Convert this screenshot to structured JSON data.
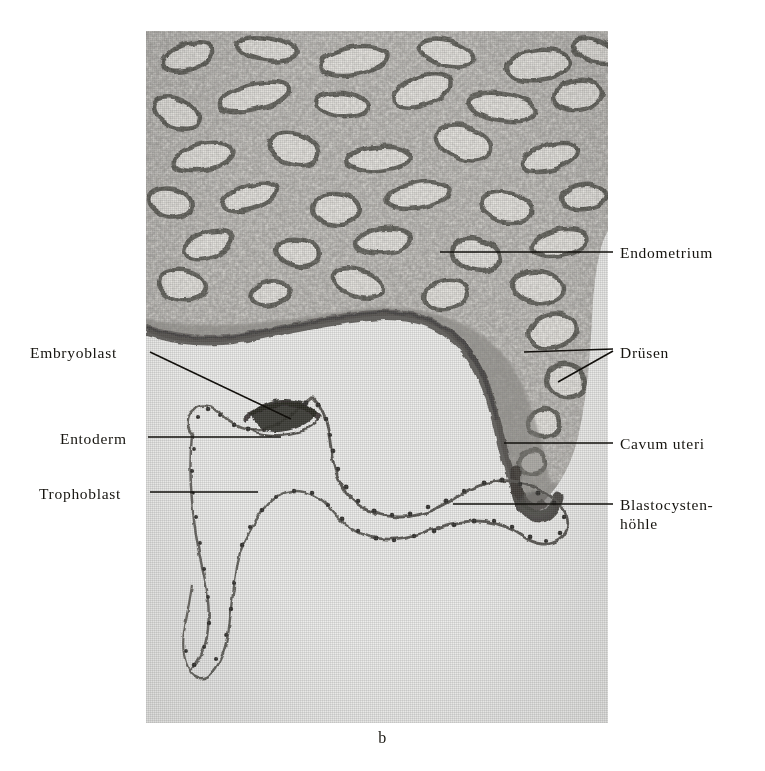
{
  "figure": {
    "caption": "b",
    "type": "histology-micrograph",
    "background_color": "#ededeb",
    "ink_color": "#16140f"
  },
  "labels": {
    "left": [
      {
        "id": "embryoblast",
        "text": "Embryoblast",
        "x": 30,
        "y": 343,
        "anchor_x": 143,
        "anchor_y": 351
      },
      {
        "id": "entoderm",
        "text": "Entoderm",
        "x": 60,
        "y": 429,
        "anchor_x": 143,
        "anchor_y": 437
      },
      {
        "id": "trophoblast",
        "text": "Trophoblast",
        "x": 39,
        "y": 484,
        "anchor_x": 143,
        "anchor_y": 492
      }
    ],
    "right": [
      {
        "id": "endometrium",
        "text": "Endometrium",
        "x": 620,
        "y": 243,
        "anchor_x": 613,
        "anchor_y": 252
      },
      {
        "id": "druesen",
        "text": "Drüsen",
        "x": 620,
        "y": 343,
        "anchor_x": 613,
        "anchor_y": 352
      },
      {
        "id": "cavum-uteri",
        "text": "Cavum uteri",
        "x": 620,
        "y": 434,
        "anchor_x": 613,
        "anchor_y": 443
      },
      {
        "id": "blastocystenhoehle-line1",
        "text": "Blastocysten-",
        "x": 620,
        "y": 495,
        "anchor_x": 613,
        "anchor_y": 504
      },
      {
        "id": "blastocystenhoehle-line2",
        "text": "höhle",
        "x": 620,
        "y": 514
      }
    ]
  },
  "leader_lines": [
    {
      "id": "leader-embryoblast",
      "x1": 150,
      "y1": 352,
      "x2": 291,
      "y2": 419
    },
    {
      "id": "leader-entoderm",
      "x1": 148,
      "y1": 437,
      "x2": 281,
      "y2": 437
    },
    {
      "id": "leader-trophoblast",
      "x1": 150,
      "y1": 492,
      "x2": 258,
      "y2": 492
    },
    {
      "id": "leader-endometrium",
      "x1": 440,
      "y1": 252,
      "x2": 613,
      "y2": 252
    },
    {
      "id": "leader-druesen-a",
      "x1": 524,
      "y1": 352,
      "x2": 613,
      "y2": 349
    },
    {
      "id": "leader-druesen-b",
      "x1": 558,
      "y1": 382,
      "x2": 613,
      "y2": 351
    },
    {
      "id": "leader-cavum-uteri",
      "x1": 504,
      "y1": 443,
      "x2": 613,
      "y2": 443
    },
    {
      "id": "leader-blastocystenhoehle",
      "x1": 453,
      "y1": 504,
      "x2": 613,
      "y2": 504
    }
  ],
  "plate": {
    "x": 146,
    "y": 31,
    "width": 462,
    "height": 692
  }
}
